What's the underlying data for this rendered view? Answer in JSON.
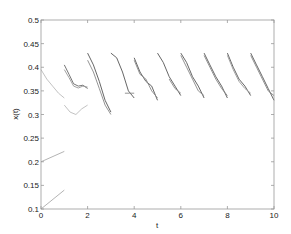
{
  "chart_data": {
    "type": "line",
    "title": "",
    "xlabel": "t",
    "ylabel": "x(t)",
    "xlim": [
      0,
      10
    ],
    "ylim": [
      0.1,
      0.5
    ],
    "xticks": [
      0,
      2,
      4,
      6,
      8,
      10
    ],
    "yticks": [
      0.1,
      0.15,
      0.2,
      0.25,
      0.3,
      0.35,
      0.4,
      0.45,
      0.5
    ],
    "xtick_labels": [
      "0",
      "2",
      "4",
      "6",
      "8",
      "10"
    ],
    "ytick_labels": [
      "0.1",
      "0.15",
      "0.2",
      "0.25",
      "0.3",
      "0.35",
      "0.4",
      "0.45",
      "0.5"
    ],
    "grid": false,
    "legend": null,
    "series": [
      {
        "name": "seg0-a",
        "color": "#bbbbbb",
        "x": [
          0,
          0.25,
          0.5,
          0.75,
          1.0
        ],
        "y": [
          0.395,
          0.375,
          0.36,
          0.345,
          0.335
        ]
      },
      {
        "name": "seg0-b",
        "color": "#aaaaaa",
        "x": [
          0,
          1.0
        ],
        "y": [
          0.2,
          0.222
        ]
      },
      {
        "name": "seg0-c",
        "color": "#aaaaaa",
        "x": [
          0,
          1.0
        ],
        "y": [
          0.1,
          0.14
        ]
      },
      {
        "name": "seg1-a",
        "color": "#bbbbbb",
        "x": [
          1.0,
          1.25,
          1.5,
          1.75,
          2.0
        ],
        "y": [
          0.32,
          0.305,
          0.3,
          0.312,
          0.32
        ]
      },
      {
        "name": "seg1-b",
        "color": "#666666",
        "x": [
          1.0,
          1.2,
          1.4,
          1.6,
          1.8,
          2.0
        ],
        "y": [
          0.405,
          0.385,
          0.365,
          0.36,
          0.362,
          0.355
        ]
      },
      {
        "name": "seg1-c",
        "color": "#999999",
        "x": [
          1.0,
          1.2,
          1.4,
          1.6,
          1.8,
          2.0
        ],
        "y": [
          0.395,
          0.378,
          0.36,
          0.356,
          0.36,
          0.358
        ]
      },
      {
        "name": "seg2-a",
        "color": "#555555",
        "x": [
          2.0,
          2.25,
          2.5,
          2.75,
          3.0
        ],
        "y": [
          0.43,
          0.405,
          0.37,
          0.33,
          0.305
        ]
      },
      {
        "name": "seg2-b",
        "color": "#888888",
        "x": [
          2.0,
          2.25,
          2.5,
          2.75,
          3.0
        ],
        "y": [
          0.415,
          0.39,
          0.355,
          0.32,
          0.3
        ]
      },
      {
        "name": "seg3-a",
        "color": "#555555",
        "x": [
          3.0,
          3.25,
          3.5,
          3.75,
          4.0
        ],
        "y": [
          0.43,
          0.42,
          0.39,
          0.35,
          0.335
        ]
      },
      {
        "name": "seg3-b",
        "color": "#888888",
        "x": [
          3.6,
          3.8,
          4.0
        ],
        "y": [
          0.345,
          0.345,
          0.345
        ]
      },
      {
        "name": "seg4-a",
        "color": "#555555",
        "x": [
          4.0,
          4.25,
          4.5,
          4.75,
          5.0
        ],
        "y": [
          0.42,
          0.39,
          0.37,
          0.36,
          0.33
        ]
      },
      {
        "name": "seg4-b",
        "color": "#888888",
        "x": [
          4.0,
          4.25,
          4.5,
          4.75,
          5.0
        ],
        "y": [
          0.415,
          0.385,
          0.375,
          0.35,
          0.335
        ]
      },
      {
        "name": "seg5-a",
        "color": "#555555",
        "x": [
          5.0,
          5.25,
          5.5,
          5.75,
          6.0
        ],
        "y": [
          0.43,
          0.41,
          0.38,
          0.36,
          0.34
        ]
      },
      {
        "name": "seg5-b",
        "color": "#888888",
        "x": [
          5.5,
          5.75,
          6.0
        ],
        "y": [
          0.375,
          0.355,
          0.345
        ]
      },
      {
        "name": "seg6-a",
        "color": "#555555",
        "x": [
          6.0,
          6.25,
          6.5,
          6.75,
          7.0
        ],
        "y": [
          0.43,
          0.41,
          0.38,
          0.36,
          0.335
        ]
      },
      {
        "name": "seg6-b",
        "color": "#888888",
        "x": [
          6.0,
          6.25,
          6.5,
          6.75,
          7.0
        ],
        "y": [
          0.425,
          0.4,
          0.375,
          0.35,
          0.34
        ]
      },
      {
        "name": "seg7-a",
        "color": "#555555",
        "x": [
          7.0,
          7.25,
          7.5,
          7.75,
          8.0
        ],
        "y": [
          0.43,
          0.405,
          0.38,
          0.36,
          0.335
        ]
      },
      {
        "name": "seg7-b",
        "color": "#888888",
        "x": [
          7.0,
          7.25,
          7.5,
          7.75,
          8.0
        ],
        "y": [
          0.425,
          0.4,
          0.375,
          0.355,
          0.34
        ]
      },
      {
        "name": "seg8-a",
        "color": "#555555",
        "x": [
          8.0,
          8.25,
          8.5,
          8.75,
          9.0
        ],
        "y": [
          0.43,
          0.4,
          0.375,
          0.36,
          0.34
        ]
      },
      {
        "name": "seg8-b",
        "color": "#999999",
        "x": [
          8.0,
          8.25,
          8.5,
          8.75,
          9.0
        ],
        "y": [
          0.425,
          0.395,
          0.37,
          0.355,
          0.345
        ]
      },
      {
        "name": "seg9-a",
        "color": "#555555",
        "x": [
          9.0,
          9.25,
          9.5,
          9.75,
          10.0
        ],
        "y": [
          0.43,
          0.405,
          0.38,
          0.355,
          0.33
        ]
      },
      {
        "name": "seg9-b",
        "color": "#888888",
        "x": [
          9.0,
          9.25,
          9.5,
          9.75,
          10.0
        ],
        "y": [
          0.425,
          0.4,
          0.375,
          0.35,
          0.34
        ]
      }
    ]
  }
}
